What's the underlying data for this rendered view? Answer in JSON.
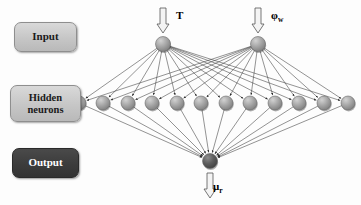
{
  "diagram": {
    "type": "feedforward-neural-network",
    "layers": [
      {
        "name": "input",
        "label": "Input",
        "node_count": 2,
        "node_color": "#a8a8a8"
      },
      {
        "name": "hidden",
        "label": "Hidden\nneurons",
        "node_count": 12,
        "node_color": "#9e9e9e"
      },
      {
        "name": "output",
        "label": "Output",
        "node_count": 1,
        "node_color": "#5c5c5c"
      }
    ]
  },
  "labels": {
    "input_box": "Input",
    "hidden_box_line1": "Hidden",
    "hidden_box_line2": "neurons",
    "output_box": "Output"
  },
  "signals": {
    "input_1": {
      "symbol": "T",
      "sub": "",
      "direction": "down"
    },
    "input_2": {
      "symbol": "φ",
      "sub": "w",
      "direction": "down"
    },
    "output_1": {
      "symbol": "μ",
      "sub": "r",
      "direction": "down"
    }
  },
  "colors": {
    "box_light_fill": "#c6c6c6",
    "box_light_border": "#8e8e8e",
    "box_dark_fill": "#3c3c3c",
    "box_dark_text": "#ffffff",
    "node_input": "#a8a8a8",
    "node_hidden": "#9e9e9e",
    "node_output": "#5c5c5c",
    "edge": "#3a3a3a",
    "background": "#fdfdfd"
  },
  "geometry": {
    "input_nodes": [
      {
        "x": 163,
        "y": 44
      },
      {
        "x": 258,
        "y": 44
      }
    ],
    "hidden_nodes": [
      {
        "x": 79,
        "y": 103
      },
      {
        "x": 103,
        "y": 103
      },
      {
        "x": 128,
        "y": 103
      },
      {
        "x": 152,
        "y": 103
      },
      {
        "x": 177,
        "y": 103
      },
      {
        "x": 201,
        "y": 103
      },
      {
        "x": 226,
        "y": 103
      },
      {
        "x": 250,
        "y": 103
      },
      {
        "x": 275,
        "y": 103
      },
      {
        "x": 299,
        "y": 103
      },
      {
        "x": 324,
        "y": 103
      },
      {
        "x": 348,
        "y": 103
      }
    ],
    "output_nodes": [
      {
        "x": 210,
        "y": 161
      }
    ],
    "node_radius_input": 7.5,
    "node_radius_hidden": 7.0,
    "node_radius_output": 7.5
  },
  "chart_data": {
    "type": "diagram",
    "nodes_per_layer": [
      2,
      12,
      1
    ],
    "connections": [
      {
        "from": "input",
        "to": "hidden",
        "count": 24,
        "style": "fully-connected-arrow"
      },
      {
        "from": "hidden",
        "to": "output",
        "count": 12,
        "style": "fully-connected-arrow"
      }
    ],
    "external_inputs": [
      "T",
      "φw"
    ],
    "external_outputs": [
      "μr"
    ]
  }
}
